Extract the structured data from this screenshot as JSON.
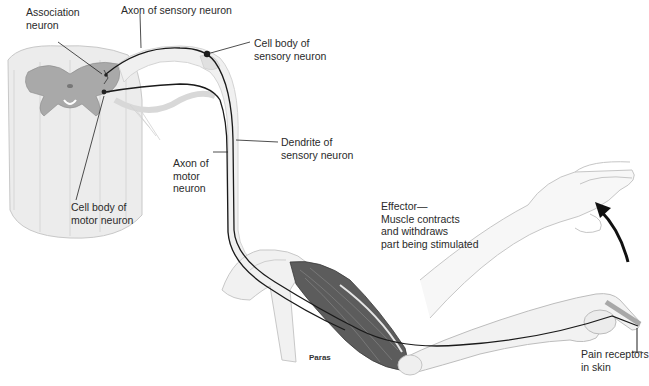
{
  "diagram": {
    "labels": {
      "association_neuron": "Association\nneuron",
      "axon_sensory": "Axon of sensory neuron",
      "cell_body_sensory": "Cell body of\nsensory neuron",
      "dendrite_sensory": "Dendrite of\nsensory neuron",
      "axon_motor": "Axon of\nmotor\nneuron",
      "cell_body_motor": "Cell body of\nmotor neuron",
      "effector": "Effector—\nMuscle contracts\nand withdraws\npart being stimulated",
      "pain_receptors": "Pain receptors\nin skin"
    },
    "credit": "Paras",
    "colors": {
      "nerve": "#1a1a1a",
      "spinal_cord": "#e8e8e8",
      "gray_matter": "#a8a8a8",
      "muscle": "#5a5a5a",
      "arm_outline": "#bdbdbd"
    }
  }
}
